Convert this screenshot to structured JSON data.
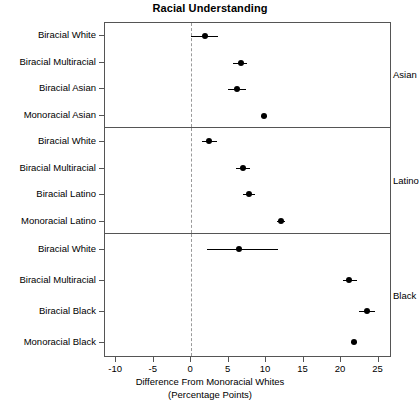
{
  "chart_data": {
    "type": "scatter",
    "title": "Racial Understanding",
    "xlabel": "Difference From Monoracial Whites",
    "xlabel_line2": "(Percentage Points)",
    "ylabel": "",
    "xlim": [
      -11.5,
      26.8
    ],
    "xticks": [
      -10,
      -5,
      0,
      5,
      10,
      15,
      20,
      25
    ],
    "xticklabels": [
      "-10",
      "-5",
      "0",
      "5",
      "10",
      "15",
      "20",
      "25"
    ],
    "grid": false,
    "legend": null,
    "reference_line": 0,
    "reference_line_style": "dashed",
    "point_color": "#000000",
    "error_bar_color": "#000000",
    "panels": [
      {
        "strip_label": "Asian",
        "categories": [
          "Biracial White",
          "Biracial Multiracial",
          "Biracial Asian",
          "Monoracial Asian"
        ],
        "values": [
          1.8,
          6.6,
          6.1,
          9.7
        ],
        "ci_low": [
          0.0,
          5.6,
          4.9,
          9.3
        ],
        "ci_high": [
          3.6,
          7.5,
          7.3,
          10.1
        ]
      },
      {
        "strip_label": "Latino",
        "categories": [
          "Biracial White",
          "Biracial Multiracial",
          "Biracial Latino",
          "Monoracial Latino"
        ],
        "values": [
          2.4,
          6.9,
          7.7,
          12.0
        ],
        "ci_low": [
          1.4,
          6.0,
          6.9,
          11.5
        ],
        "ci_high": [
          3.5,
          7.9,
          8.5,
          12.5
        ]
      },
      {
        "strip_label": "Black",
        "categories": [
          "Biracial White",
          "Biracial Multiracial",
          "Biracial Black",
          "Monoracial Black"
        ],
        "values": [
          6.4,
          21.1,
          23.4,
          21.7
        ],
        "ci_low": [
          2.1,
          20.2,
          22.4,
          21.3
        ],
        "ci_high": [
          11.6,
          22.1,
          24.5,
          22.1
        ]
      }
    ]
  }
}
